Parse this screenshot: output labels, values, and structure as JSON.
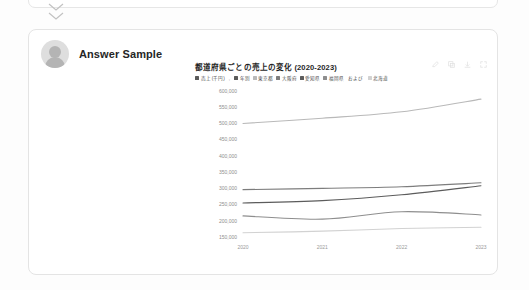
{
  "top_card": {
    "collapse_icon_1": "chevron-double-down-icon",
    "collapse_icon_2": "chevron-double-down-icon"
  },
  "answer_card": {
    "avatar_icon": "user-avatar-icon",
    "author": "Answer Sample"
  },
  "chart_toolbar": {
    "icons": [
      {
        "name": "edit-icon",
        "glyph": "edit"
      },
      {
        "name": "copy-icon",
        "glyph": "copy"
      },
      {
        "name": "download-icon",
        "glyph": "download"
      },
      {
        "name": "expand-icon",
        "glyph": "expand"
      }
    ]
  },
  "chart_data": {
    "type": "line",
    "title": "都道府県ごとの売上の変化 (2020-2023)",
    "xlabel": "年別",
    "ylabel": "売上 (千円)",
    "x": [
      "2020",
      "2021",
      "2022",
      "2023"
    ],
    "xlim": [
      "2020",
      "2023"
    ],
    "ylim": [
      150000,
      600000
    ],
    "yticks": [
      150000,
      200000,
      250000,
      300000,
      350000,
      400000,
      450000,
      500000,
      550000,
      600000
    ],
    "ytick_labels": [
      "150,000",
      "200,000",
      "250,000",
      "300,000",
      "350,000",
      "400,000",
      "450,000",
      "500,000",
      "550,000",
      "600,000"
    ],
    "grid": false,
    "legend_position": "top-left",
    "legend_prefix": [
      {
        "label": "売上 (千円)",
        "color": "#5a5a5a"
      },
      {
        "label": "年別",
        "color": "#5a5a5a"
      }
    ],
    "legend_conjunction": "および",
    "series": [
      {
        "name": "東京都",
        "color": "#b9b9b9",
        "values": [
          500000,
          516000,
          536000,
          575000
        ]
      },
      {
        "name": "大阪府",
        "color": "#7d7d7d",
        "values": [
          296000,
          300000,
          305000,
          317000
        ]
      },
      {
        "name": "愛知県",
        "color": "#5c5c5c",
        "values": [
          255000,
          262000,
          280000,
          308000
        ]
      },
      {
        "name": "福岡県",
        "color": "#8e8e8e",
        "values": [
          215000,
          205000,
          228000,
          218000
        ]
      },
      {
        "name": "北海道",
        "color": "#d2d2d2",
        "values": [
          163000,
          168000,
          176000,
          180000
        ]
      }
    ]
  }
}
